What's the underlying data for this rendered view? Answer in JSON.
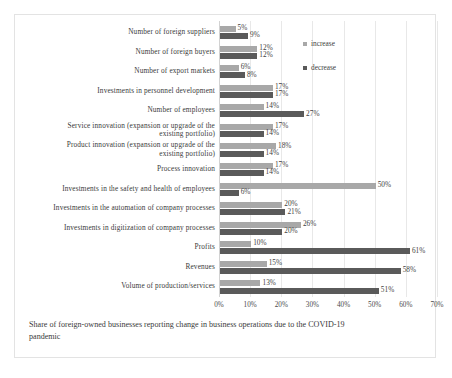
{
  "figure": {
    "caption": "Share of foreign-owned businesses reporting change in business operations due to the COVID-19 pandemic"
  },
  "legend": {
    "increase_label": "increase",
    "decrease_label": "decrease"
  },
  "colors": {
    "increase": "#a8a8a8",
    "decrease": "#5a5a5a",
    "grid": "#e8e8e8",
    "frame": "#e3e3e3",
    "text": "#3a3a3a"
  },
  "chart_data": {
    "type": "bar",
    "orientation": "horizontal",
    "title": "",
    "subtitle": "",
    "xlabel": "",
    "ylabel": "",
    "xlim": [
      0,
      70
    ],
    "xticks": [
      0,
      10,
      20,
      30,
      40,
      50,
      60,
      70
    ],
    "xticklabels": [
      "0%",
      "10%",
      "20%",
      "30%",
      "40%",
      "50%",
      "60%",
      "70%"
    ],
    "grid": true,
    "legend_position": "inside-top-right",
    "value_label_suffix": "%",
    "categories": [
      "Number of foreign suppliers",
      "Number of foreign buyers",
      "Number of export markets",
      "Investments in personnel development",
      "Number of employees",
      "Service innovation (expansion or upgrade of the\nexisting portfolio)",
      "Product innovation (expansion or upgrade of the\nexisting portfolio)",
      "Process innovation",
      "Investments in the safety and health of employees",
      "Investments in the automation of company processes",
      "Investments in digitization of company processes",
      "Profits",
      "Revenues",
      "Volume of production/services"
    ],
    "series": [
      {
        "name": "increase",
        "color": "#a8a8a8",
        "values": [
          5,
          12,
          6,
          17,
          14,
          17,
          18,
          17,
          50,
          20,
          26,
          10,
          15,
          13
        ],
        "labels": [
          "5%",
          "12%",
          "6%",
          "17%",
          "14%",
          "17%",
          "18%",
          "17%",
          "50%",
          "20%",
          "26%",
          "10%",
          "15%",
          "13%"
        ]
      },
      {
        "name": "decrease",
        "color": "#5a5a5a",
        "values": [
          9,
          12,
          8,
          17,
          27,
          14,
          14,
          14,
          6,
          21,
          20,
          61,
          58,
          51
        ],
        "labels": [
          "9%",
          "12%",
          "8%",
          "17%",
          "27%",
          "14%",
          "14%",
          "14%",
          "6%",
          "21%",
          "20%",
          "61%",
          "58%",
          "51%"
        ]
      }
    ]
  }
}
